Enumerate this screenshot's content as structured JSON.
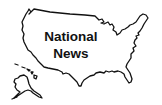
{
  "graphic": {
    "title_line1": "National",
    "title_line2": "News",
    "icon": "us-map-outline-icon",
    "stroke_color": "#111111",
    "background_color": "#ffffff"
  }
}
